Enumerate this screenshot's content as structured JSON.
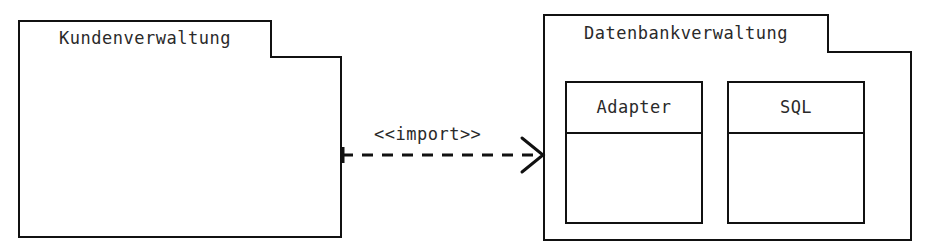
{
  "diagram": {
    "type": "uml-package-diagram",
    "title": "",
    "background_color": "#ffffff",
    "line_color": "#111111",
    "text_color": "#2a2a2a"
  },
  "packages": [
    {
      "id": "kundenverwaltung",
      "name": "Kundenverwaltung",
      "tab": {
        "x": 18,
        "y": 20,
        "width": 254,
        "height": 37
      },
      "body": {
        "x": 18,
        "y": 56,
        "width": 324,
        "height": 182
      },
      "contents": []
    },
    {
      "id": "datenbankverwaltung",
      "name": "Datenbankverwaltung",
      "tab": {
        "x": 543,
        "y": 14,
        "width": 286,
        "height": 38
      },
      "body": {
        "x": 543,
        "y": 51,
        "width": 369,
        "height": 190
      },
      "contents": [
        "adapter",
        "sql"
      ]
    }
  ],
  "classes": [
    {
      "id": "adapter",
      "name": "Adapter",
      "box": {
        "x": 565,
        "y": 81,
        "width": 138,
        "height": 143
      },
      "name_compartment_height": 51,
      "attributes": [],
      "operations": []
    },
    {
      "id": "sql",
      "name": "SQL",
      "box": {
        "x": 727,
        "y": 81,
        "width": 138,
        "height": 143
      },
      "name_compartment_height": 51,
      "attributes": [],
      "operations": []
    }
  ],
  "relationships": [
    {
      "id": "import-dependency",
      "kind": "dependency",
      "stereotype": "<<import>>",
      "source": "kundenverwaltung",
      "target": "datenbankverwaltung",
      "line_style": "dashed",
      "arrowhead": "open",
      "from": {
        "x": 342,
        "y": 155
      },
      "to": {
        "x": 543,
        "y": 155
      },
      "label_position": {
        "x": 374,
        "y": 126
      }
    }
  ]
}
